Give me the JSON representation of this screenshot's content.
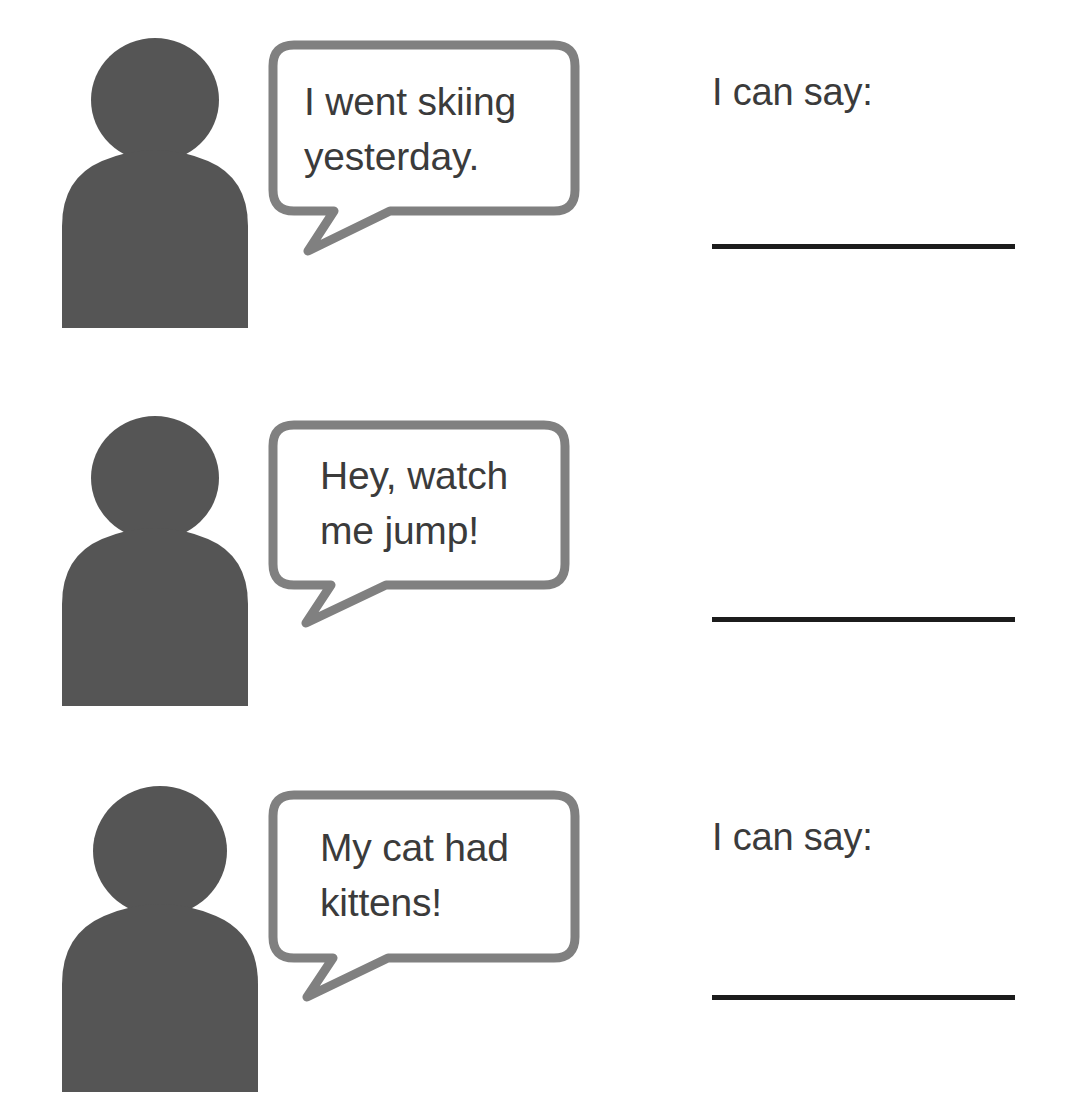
{
  "page": {
    "background_color": "#ffffff",
    "person_icon_color": "#555555",
    "bubble_stroke_color": "#808080",
    "bubble_fill_color": "#ffffff",
    "text_color": "#3b3b3b",
    "answer_line_color": "#1c1c1c"
  },
  "rows": [
    {
      "person_icon": "person-silhouette-icon",
      "bubble": {
        "icon": "speech-bubble-icon",
        "text": "I went skiing\nyesterday."
      },
      "answer": {
        "label": "I can say:",
        "line": ""
      }
    },
    {
      "person_icon": "person-silhouette-icon",
      "bubble": {
        "icon": "speech-bubble-icon",
        "text": "Hey, watch\nme jump!"
      },
      "answer": {
        "label": "I can say:",
        "line": ""
      }
    },
    {
      "person_icon": "person-silhouette-icon",
      "bubble": {
        "icon": "speech-bubble-icon",
        "text": "My cat had\nkittens!"
      },
      "answer": {
        "label": "I can say:",
        "line": ""
      }
    }
  ]
}
